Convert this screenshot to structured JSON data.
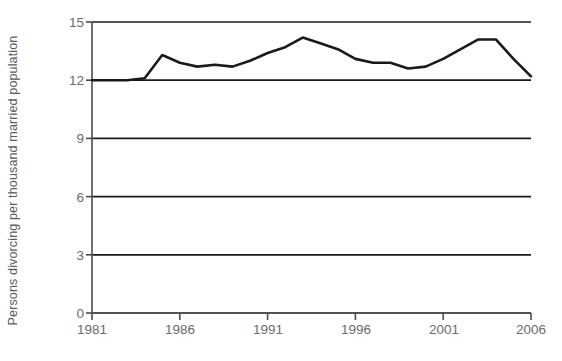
{
  "chart_data": {
    "type": "line",
    "title": "",
    "subtitle": "",
    "xlabel": "",
    "ylabel": "Persons divorcing per thousand married population",
    "xlim": [
      1981,
      2006
    ],
    "ylim": [
      0,
      15
    ],
    "yticks": [
      0,
      3,
      6,
      9,
      12,
      15
    ],
    "ytick_labels": [
      "0",
      "3",
      "6",
      "9",
      "12",
      "15"
    ],
    "xticks": [
      1981,
      1986,
      1991,
      1996,
      2001,
      2006
    ],
    "xtick_labels": [
      "1981",
      "1986",
      "1991",
      "1996",
      "2001",
      "2006"
    ],
    "grid": true,
    "grid_axis": "y",
    "legend": false,
    "legend_position": "none",
    "annotations": [],
    "line_color": "#1a1a1a",
    "grid_color": "#1a1a1a",
    "axis_color": "#4d4d4d",
    "tick_label_color": "#6b6b6b",
    "series": [
      {
        "name": "Divorce rate",
        "x": [
          1981,
          1982,
          1983,
          1984,
          1985,
          1986,
          1987,
          1988,
          1989,
          1990,
          1991,
          1992,
          1993,
          1994,
          1995,
          1996,
          1997,
          1998,
          1999,
          2000,
          2001,
          2002,
          2003,
          2004,
          2005,
          2006
        ],
        "values": [
          12.0,
          12.0,
          12.0,
          12.1,
          13.3,
          12.9,
          12.7,
          12.8,
          12.7,
          13.0,
          13.4,
          13.7,
          14.2,
          13.9,
          13.6,
          13.1,
          12.9,
          12.9,
          12.6,
          12.7,
          13.1,
          13.6,
          14.1,
          14.1,
          13.1,
          12.2
        ]
      }
    ]
  },
  "axes": {
    "y_axis_title": "Persons divorcing per thousand married population"
  }
}
